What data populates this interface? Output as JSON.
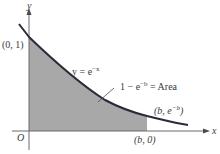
{
  "diagram": {
    "type": "area-under-curve",
    "colors": {
      "curve": "#2a2a3a",
      "area": "#a8a8a8",
      "axis": "#6a6a72",
      "text": "#3a3a3a"
    },
    "axes": {
      "x_label": "x",
      "y_label": "y",
      "origin_label": "O"
    },
    "labels": {
      "y_intercept": "(0, 1)",
      "curve_equation": "y = e",
      "curve_exponent": "−x",
      "area_prefix": "1 − e",
      "area_exponent": "−b",
      "area_suffix": " = Area",
      "point_b_curve_prefix": "(b,  e",
      "point_b_curve_exponent": "−b",
      "point_b_curve_suffix": ")",
      "point_b_axis": "(b, 0)"
    }
  }
}
